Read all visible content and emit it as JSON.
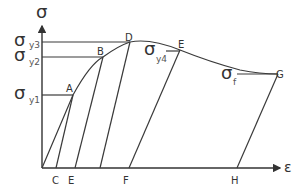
{
  "diagram": {
    "axes": {
      "y_label": "σ",
      "x_label": "ε"
    },
    "stress_levels": [
      {
        "symbol": "σ",
        "sub": "y3"
      },
      {
        "symbol": "σ",
        "sub": "y2"
      },
      {
        "symbol": "σ",
        "sub": "y1"
      },
      {
        "symbol": "σ",
        "sub": "y4"
      },
      {
        "symbol": "σ",
        "sub": "f"
      }
    ],
    "curve_points": {
      "A": "A",
      "B": "B",
      "D": "D",
      "E": "E",
      "G": "G"
    },
    "strain_points": {
      "C": "C",
      "E": "E",
      "F": "F",
      "H": "H"
    }
  }
}
